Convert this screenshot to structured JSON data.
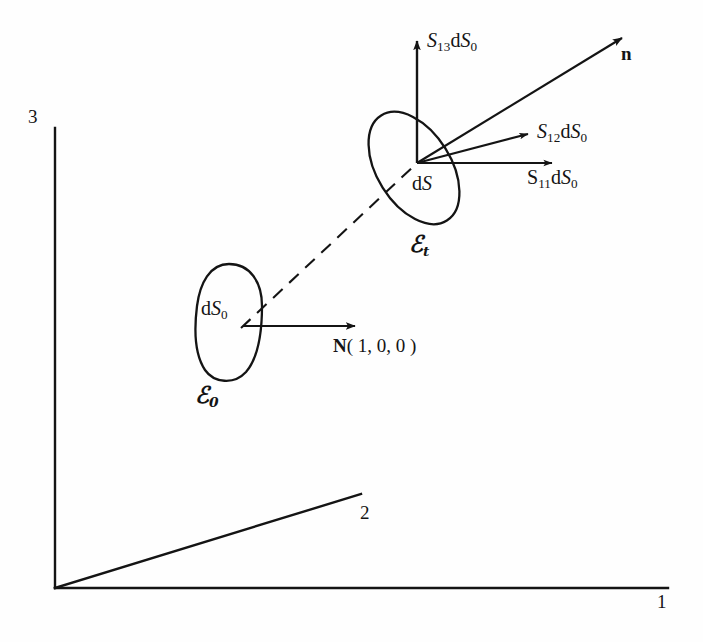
{
  "figure": {
    "background_color": "#fefefe",
    "ink_color": "#141414"
  },
  "axes": {
    "origin_label": "",
    "items": [
      {
        "name": "axis-1",
        "label": "1",
        "direction": "horizontal-right"
      },
      {
        "name": "axis-2",
        "label": "2",
        "direction": "diagonal-up-right"
      },
      {
        "name": "axis-3",
        "label": "3",
        "direction": "vertical-up"
      }
    ]
  },
  "reference_config": {
    "region_label": "ℰ",
    "region_label_sub": "0",
    "area_label_prefix": "d",
    "area_label_symbol": "S",
    "area_label_sub": "0",
    "normal_vector": {
      "symbol": "N",
      "components": "( 1, 0, 0 )"
    }
  },
  "current_config": {
    "region_label": "ℰ",
    "region_label_sub": "t",
    "area_label_prefix": "d",
    "area_label_symbol": "S",
    "unit_normal": "n",
    "traction_vectors": [
      {
        "name": "s13",
        "symbol": "S",
        "sub": "13",
        "area_prefix": "d",
        "area_symbol": "S",
        "area_sub": "0",
        "direction": "up"
      },
      {
        "name": "s12",
        "symbol": "S",
        "sub": "12",
        "area_prefix": "d",
        "area_symbol": "S",
        "area_sub": "0",
        "direction": "up-right"
      },
      {
        "name": "s11",
        "symbol": "S",
        "sub": "11",
        "area_prefix": "d",
        "area_symbol": "S",
        "area_sub": "0",
        "direction": "right"
      }
    ]
  },
  "connector": {
    "style": "dashed",
    "description": "motion mapping from reference to current surface element"
  }
}
